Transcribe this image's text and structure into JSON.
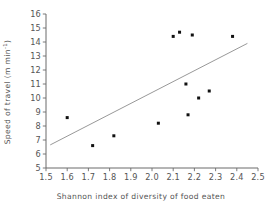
{
  "chart_data": {
    "type": "scatter",
    "title": "",
    "xlabel": "Shannon index of diversity of food eaten",
    "ylabel": "Speed of travel (m min⁻¹)",
    "ylabel_main": "Speed of travel (m min",
    "ylabel_sup": "-1",
    "ylabel_tail": ")",
    "xlim": [
      1.5,
      2.5
    ],
    "ylim": [
      5,
      16
    ],
    "grid": false,
    "legend": "none",
    "xticks": [
      1.5,
      1.6,
      1.7,
      1.8,
      1.9,
      2.0,
      2.1,
      2.2,
      2.3,
      2.4,
      2.5
    ],
    "xtick_labels": [
      "1.5",
      "1.6",
      "1.7",
      "1.8",
      "1.9",
      "2.0",
      "2.1",
      "2.2",
      "2.3",
      "2.4",
      "2.5"
    ],
    "yticks": [
      5,
      6,
      7,
      8,
      9,
      10,
      11,
      12,
      13,
      14,
      15,
      16
    ],
    "ytick_labels": [
      "5",
      "6",
      "7",
      "8",
      "9",
      "10",
      "11",
      "12",
      "13",
      "14",
      "15",
      "16"
    ],
    "points": [
      {
        "x": 1.6,
        "y": 8.6
      },
      {
        "x": 1.72,
        "y": 6.6
      },
      {
        "x": 1.82,
        "y": 7.3
      },
      {
        "x": 2.03,
        "y": 8.2
      },
      {
        "x": 2.1,
        "y": 14.4
      },
      {
        "x": 2.13,
        "y": 14.7
      },
      {
        "x": 2.19,
        "y": 14.5
      },
      {
        "x": 2.16,
        "y": 11.0
      },
      {
        "x": 2.17,
        "y": 8.8
      },
      {
        "x": 2.22,
        "y": 10.0
      },
      {
        "x": 2.27,
        "y": 10.5
      },
      {
        "x": 2.38,
        "y": 14.4
      }
    ],
    "marker": {
      "shape": "square",
      "size_px": 3.0,
      "color": "#111111"
    },
    "trendline": {
      "type": "linear-fit",
      "x_start": 1.52,
      "y_start": 6.65,
      "x_end": 2.45,
      "y_end": 13.9,
      "color": "#8c8c8c"
    },
    "axis_color": "#6b6b6b",
    "background": "#ffffff"
  }
}
